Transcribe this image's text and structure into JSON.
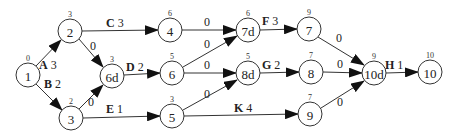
{
  "diagram": {
    "type": "activity-on-arrow network",
    "nodes": [
      {
        "id": "1",
        "label": "1",
        "time": "0",
        "x": 28,
        "y": 75
      },
      {
        "id": "2",
        "label": "2",
        "time": "3",
        "x": 70,
        "y": 31
      },
      {
        "id": "3",
        "label": "3",
        "time": "2",
        "x": 71,
        "y": 118
      },
      {
        "id": "6d",
        "label": "6d",
        "time": "3",
        "x": 112,
        "y": 76
      },
      {
        "id": "4",
        "label": "4",
        "time": "6",
        "x": 170,
        "y": 30
      },
      {
        "id": "6",
        "label": "6",
        "time": "5",
        "x": 172,
        "y": 73
      },
      {
        "id": "5",
        "label": "5",
        "time": "3",
        "x": 172,
        "y": 116
      },
      {
        "id": "7d",
        "label": "7d",
        "time": "6",
        "x": 248,
        "y": 30
      },
      {
        "id": "8d",
        "label": "8d",
        "time": "5",
        "x": 248,
        "y": 73
      },
      {
        "id": "7",
        "label": "7",
        "time": "9",
        "x": 309,
        "y": 29
      },
      {
        "id": "8",
        "label": "8",
        "time": "7",
        "x": 311,
        "y": 72
      },
      {
        "id": "9",
        "label": "9",
        "time": "7",
        "x": 310,
        "y": 114
      },
      {
        "id": "10d",
        "label": "10d",
        "time": "9",
        "x": 374,
        "y": 73
      },
      {
        "id": "10",
        "label": "10",
        "time": "10",
        "x": 430,
        "y": 72
      }
    ],
    "edges": [
      {
        "from": "1",
        "to": "2",
        "activity": "A",
        "duration": "3"
      },
      {
        "from": "1",
        "to": "3",
        "activity": "B",
        "duration": "2"
      },
      {
        "from": "2",
        "to": "4",
        "activity": "C",
        "duration": "3"
      },
      {
        "from": "2",
        "to": "6d",
        "activity": "",
        "duration": "0"
      },
      {
        "from": "3",
        "to": "6d",
        "activity": "",
        "duration": "0"
      },
      {
        "from": "6d",
        "to": "6",
        "activity": "D",
        "duration": "2"
      },
      {
        "from": "3",
        "to": "5",
        "activity": "E",
        "duration": "1"
      },
      {
        "from": "4",
        "to": "7d",
        "activity": "",
        "duration": "0"
      },
      {
        "from": "6",
        "to": "7d",
        "activity": "",
        "duration": "0"
      },
      {
        "from": "6",
        "to": "8d",
        "activity": "",
        "duration": "0"
      },
      {
        "from": "5",
        "to": "8d",
        "activity": "",
        "duration": "0"
      },
      {
        "from": "7d",
        "to": "7",
        "activity": "F",
        "duration": "3"
      },
      {
        "from": "8d",
        "to": "8",
        "activity": "G",
        "duration": "2"
      },
      {
        "from": "5",
        "to": "9",
        "activity": "K",
        "duration": "4"
      },
      {
        "from": "7",
        "to": "10d",
        "activity": "",
        "duration": "0"
      },
      {
        "from": "8",
        "to": "10d",
        "activity": "",
        "duration": "0"
      },
      {
        "from": "9",
        "to": "10d",
        "activity": "",
        "duration": "0"
      },
      {
        "from": "10d",
        "to": "10",
        "activity": "H",
        "duration": "1"
      }
    ]
  },
  "labels": {
    "n1": "1",
    "n1_time": "0",
    "n2": "2",
    "n2_time": "3",
    "n3": "3",
    "n3_time": "2",
    "n6d": "6d",
    "n6d_time": "3",
    "n4": "4",
    "n4_time": "6",
    "n6": "6",
    "n6_time": "5",
    "n5": "5",
    "n5_time": "3",
    "n7d": "7d",
    "n7d_time": "6",
    "n8d": "8d",
    "n8d_time": "5",
    "n7": "7",
    "n7_time": "9",
    "n8": "8",
    "n8_time": "7",
    "n9": "9",
    "n9_time": "7",
    "n10d": "10d",
    "n10d_time": "9",
    "n10": "10",
    "n10_time": "10",
    "eA_act": "A",
    "eA_dur": " 3",
    "eB_act": "B",
    "eB_dur": " 2",
    "eC_act": "C",
    "eC_dur": " 3",
    "eD_act": "D",
    "eD_dur": " 2",
    "eE_act": "E",
    "eE_dur": " 1",
    "eF_act": "F",
    "eF_dur": " 3",
    "eG_act": "G",
    "eG_dur": " 2",
    "eK_act": "K",
    "eK_dur": " 4",
    "eH_act": "H",
    "eH_dur": " 1",
    "dummy": "0"
  }
}
